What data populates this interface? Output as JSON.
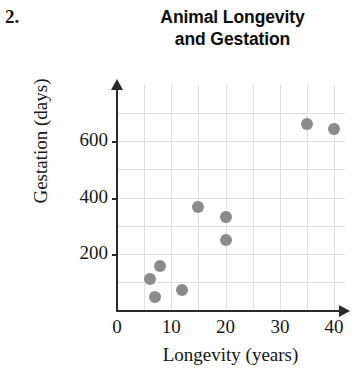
{
  "problem_number": "2.",
  "chart_data": {
    "type": "scatter",
    "title": "Animal Longevity and Gestation",
    "title_lines": [
      "Animal Longevity",
      "and Gestation"
    ],
    "xlabel": "Longevity (years)",
    "ylabel": "Gestation (days)",
    "xlim": [
      0,
      42
    ],
    "ylim": [
      0,
      800
    ],
    "xticks": [
      0,
      10,
      20,
      30,
      40
    ],
    "xtick_labels": [
      "0",
      "10",
      "20",
      "30",
      "40"
    ],
    "yticks": [
      200,
      400,
      600
    ],
    "ytick_labels": [
      "200",
      "400",
      "600"
    ],
    "x_gridlines": [
      5,
      10,
      15,
      20,
      25,
      30,
      35,
      40
    ],
    "y_gridlines": [
      100,
      200,
      300,
      400,
      500,
      600,
      700
    ],
    "grid": true,
    "legend": "none",
    "point_color": "#8b8b8b",
    "points": [
      {
        "x": 6,
        "y": 110
      },
      {
        "x": 7,
        "y": 45
      },
      {
        "x": 8,
        "y": 155
      },
      {
        "x": 12,
        "y": 70
      },
      {
        "x": 15,
        "y": 365
      },
      {
        "x": 20,
        "y": 330
      },
      {
        "x": 20,
        "y": 250
      },
      {
        "x": 35,
        "y": 660
      },
      {
        "x": 40,
        "y": 645
      }
    ]
  }
}
